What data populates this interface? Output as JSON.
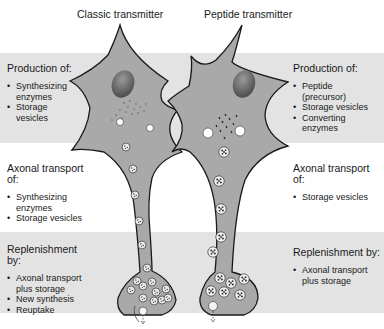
{
  "titles": {
    "classic": "Classic transmitter",
    "peptide": "Peptide transmitter"
  },
  "classic": {
    "production": {
      "heading": "Production of:",
      "items": [
        "Synthesizing enzymes",
        "Storage vesicles"
      ]
    },
    "transport": {
      "heading": "Axonal transport of:",
      "items": [
        "Synthesizing enzymes",
        "Storage vesicles"
      ]
    },
    "replenishment": {
      "heading": "Replenishment by:",
      "items": [
        "Axonal transport plus storage",
        "New synthesis",
        "Reuptake"
      ]
    }
  },
  "peptide": {
    "production": {
      "heading": "Production of:",
      "items": [
        "Peptide (precursor)",
        "Storage vesicles",
        "Converting enzymes"
      ]
    },
    "transport": {
      "heading": "Axonal transport of:",
      "items": [
        "Storage vesicles"
      ]
    },
    "replenishment": {
      "heading": "Replenishment by:",
      "items": [
        "Axonal transport plus storage"
      ]
    }
  },
  "colors": {
    "band": "#e3e3e3",
    "cell": "#a9a9a9",
    "nucleus": "#6e6e6e",
    "outline": "#1a1a1a"
  }
}
